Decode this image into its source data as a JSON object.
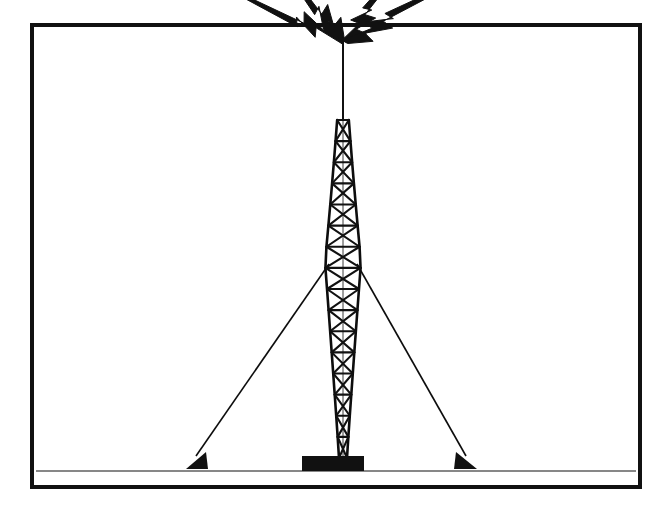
{
  "document": {
    "title": "Broadcast Radio Tower Illustration",
    "kind": "line-art-clipart",
    "background_color": "#ffffff",
    "ink_color": "#0d0d0d",
    "canvas": {
      "width": 668,
      "height": 506
    }
  },
  "frame": {
    "name": "border-frame",
    "x": 32,
    "y": 25,
    "width": 608,
    "height": 462,
    "stroke_width": 4,
    "stroke_color": "#111111",
    "fill": "none"
  },
  "tower": {
    "label": "guyed lattice broadcast tower",
    "apex_x": 343,
    "apex_y": 38,
    "base_y": 458,
    "widest_y": 262,
    "widest_half_width": 18,
    "mast_tip_half_width": 1,
    "base_half_width": 4,
    "stroke_color": "#111111",
    "member_stroke_width": 2.1,
    "panel_count": 16,
    "profile_note": "hourglass / diamond silhouette: narrow at antenna tip, widest near guy attachment, tapering to a narrow footing"
  },
  "antenna_mast": {
    "label": "top antenna whip",
    "from_y": 38,
    "to_y": 120,
    "stroke_width": 2
  },
  "foundation": {
    "label": "concrete base pad",
    "x": 302,
    "y": 456,
    "width": 62,
    "height": 15,
    "fill": "#111111"
  },
  "guy_wires": [
    {
      "name": "guy-wire-left",
      "x1": 329,
      "y1": 264,
      "x2": 196,
      "y2": 456,
      "stroke_width": 1.6
    },
    {
      "name": "guy-wire-right",
      "x1": 357,
      "y1": 264,
      "x2": 466,
      "y2": 456,
      "stroke_width": 1.6
    }
  ],
  "anchors": [
    {
      "name": "guy-anchor-left",
      "apex_x": 206,
      "apex_y": 452,
      "base_left_x": 186,
      "base_right_x": 208,
      "base_y": 469,
      "fill": "#111111"
    },
    {
      "name": "guy-anchor-right",
      "apex_x": 456,
      "apex_y": 452,
      "base_left_x": 454,
      "base_right_x": 477,
      "base_y": 469,
      "fill": "#111111"
    }
  ],
  "ground_line": {
    "name": "ground-line",
    "y": 471,
    "x1": 36,
    "x2": 636,
    "stroke_width": 1.2
  },
  "signal_bolts": {
    "label": "radiating broadcast signal lightning bolts",
    "count": 4,
    "fill": "#111111",
    "origin": {
      "x": 343,
      "y": 42
    },
    "items": [
      {
        "name": "signal-bolt-left-outer",
        "side": "left",
        "direction_deg": 205,
        "tip_x": 197,
        "tip_y": 107,
        "length": 160
      },
      {
        "name": "signal-bolt-left-inner",
        "side": "left",
        "direction_deg": 232,
        "tip_x": 255,
        "tip_y": 150,
        "length": 130
      },
      {
        "name": "signal-bolt-right-inner",
        "side": "right",
        "direction_deg": 308,
        "tip_x": 443,
        "tip_y": 137,
        "length": 130
      },
      {
        "name": "signal-bolt-right-outer",
        "side": "right",
        "direction_deg": 332,
        "tip_x": 498,
        "tip_y": 108,
        "length": 168
      }
    ]
  }
}
